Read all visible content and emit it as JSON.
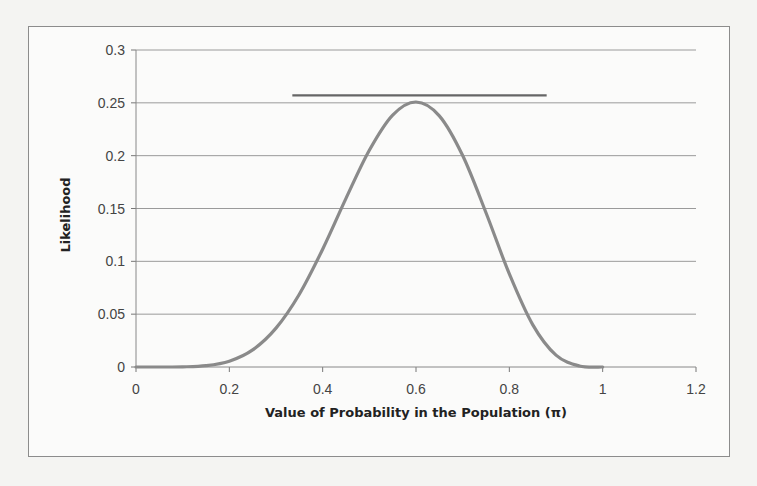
{
  "chart_data": {
    "type": "line",
    "title": "",
    "xlabel": "Value of Probability in the Population (π)",
    "ylabel": "Likelihood",
    "xlim": [
      0,
      1.2
    ],
    "ylim": [
      0,
      0.3
    ],
    "x_ticks": [
      "0",
      "0.2",
      "0.4",
      "0.6",
      "0.8",
      "1",
      "1.2"
    ],
    "y_ticks": [
      "0",
      "0.05",
      "0.1",
      "0.15",
      "0.2",
      "0.25",
      "0.3"
    ],
    "grid": {
      "horizontal": true,
      "vertical": false
    },
    "legend": null,
    "series": [
      {
        "name": "Likelihood",
        "color": "#8a8a8a",
        "x": [
          0,
          0.05,
          0.1,
          0.15,
          0.2,
          0.25,
          0.3,
          0.35,
          0.4,
          0.45,
          0.5,
          0.55,
          0.6,
          0.65,
          0.7,
          0.75,
          0.8,
          0.85,
          0.9,
          0.95,
          1.0
        ],
        "values": [
          0,
          3e-06,
          0.00014,
          0.00125,
          0.0055,
          0.0162,
          0.0368,
          0.0689,
          0.1115,
          0.1596,
          0.2051,
          0.2384,
          0.2508,
          0.2377,
          0.2001,
          0.146,
          0.0881,
          0.0401,
          0.0112,
          0.001,
          0
        ]
      }
    ],
    "annotations": [
      {
        "type": "hline",
        "y": 0.257,
        "x_start": 0.335,
        "x_end": 0.88,
        "color": "#666666",
        "note": "maximum likelihood reference line"
      }
    ]
  },
  "colors": {
    "curve": "#8a8a8a",
    "max_line": "#666666",
    "grid": "#9a9a9a",
    "frame": "#8c8c8c"
  }
}
